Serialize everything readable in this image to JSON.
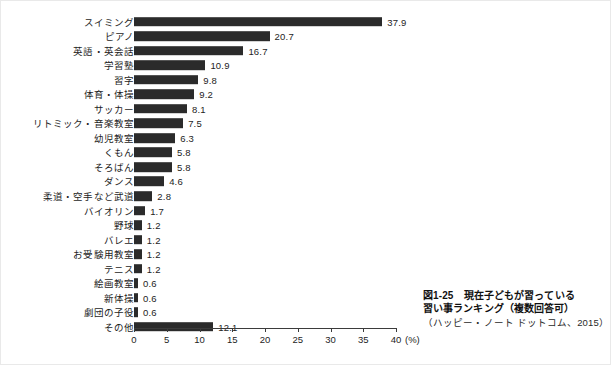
{
  "chart_data": {
    "type": "bar",
    "orientation": "horizontal",
    "source": "（ハッピー・ノート ドットコム、2015）",
    "xlabel": "(%)",
    "ylabel": "",
    "xlim": [
      0,
      40
    ],
    "xticks": [
      0,
      5,
      10,
      15,
      20,
      25,
      30,
      35,
      40
    ],
    "xtick_labels": [
      "0",
      "5",
      "10",
      "15",
      "20",
      "25",
      "30",
      "35",
      "40"
    ],
    "grid": false,
    "legend": false,
    "bar_color": "#2b2b2b",
    "categories": [
      "スイミング",
      "ピアノ",
      "英語・英会話",
      "学習塾",
      "習字",
      "体育・体操",
      "サッカー",
      "リトミック・音楽教室",
      "幼児教室",
      "くもん",
      "そろばん",
      "ダンス",
      "柔道・空手など武道",
      "バイオリン",
      "野球",
      "バレエ",
      "お受験用教室",
      "テニス",
      "絵画教室",
      "新体操",
      "劇団の子役",
      "その他"
    ],
    "values": [
      37.9,
      20.7,
      16.7,
      10.9,
      9.8,
      9.2,
      8.1,
      7.5,
      6.3,
      5.8,
      5.8,
      4.6,
      2.8,
      1.7,
      1.2,
      1.2,
      1.2,
      1.2,
      0.6,
      0.6,
      0.6,
      12.1
    ],
    "value_labels": [
      "37.9",
      "20.7",
      "16.7",
      "10.9",
      "9.8",
      "9.2",
      "8.1",
      "7.5",
      "6.3",
      "5.8",
      "5.8",
      "4.6",
      "2.8",
      "1.7",
      "1.2",
      "1.2",
      "1.2",
      "1.2",
      "0.6",
      "0.6",
      "0.6",
      "12.1"
    ]
  },
  "caption": {
    "line1": "図1-25　現在子どもが習っている",
    "line2": "習い事ランキング（複数回答可）",
    "source": "（ハッピー・ノート ドットコム、2015）"
  },
  "axis": {
    "unit": "(%)"
  }
}
